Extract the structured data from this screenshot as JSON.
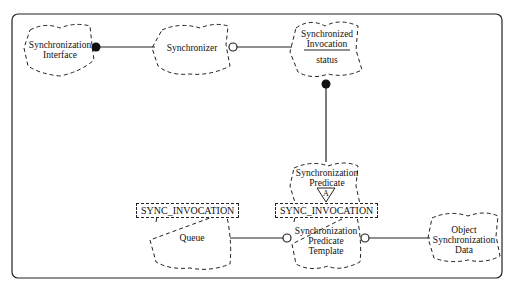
{
  "diagram": {
    "type": "Booch class diagram",
    "classes": [
      {
        "id": "sync_interface",
        "label_lines": [
          "Synchronization",
          "Interface"
        ]
      },
      {
        "id": "synchronizer",
        "label_lines": [
          "Synchronizer"
        ]
      },
      {
        "id": "sync_invocation",
        "label_lines": [
          "Synchronized",
          "Invocation"
        ],
        "attribute": "status"
      },
      {
        "id": "sync_predicate",
        "label_lines": [
          "Synchronization",
          "Predicate"
        ],
        "adornment": "A"
      },
      {
        "id": "queue",
        "label_lines": [
          "Queue"
        ],
        "template_param": "SYNC_INVOCATION"
      },
      {
        "id": "sync_predicate_template",
        "label_lines": [
          "Synchronization",
          "Predicate",
          "Template"
        ],
        "template_param": "SYNC_INVOCATION"
      },
      {
        "id": "object_sync_data",
        "label_lines": [
          "Object",
          "Synchronization",
          "Data"
        ]
      }
    ],
    "relationships": [
      {
        "from": "sync_interface",
        "to": "synchronizer",
        "kind": "has",
        "end": "filled-circle"
      },
      {
        "from": "synchronizer",
        "to": "sync_invocation",
        "kind": "uses",
        "end": "open-circle"
      },
      {
        "from": "sync_invocation",
        "to": "sync_predicate",
        "kind": "has",
        "end": "filled-circle"
      },
      {
        "from": "sync_predicate_template",
        "to": "sync_predicate",
        "kind": "instantiates",
        "end": "arrow"
      },
      {
        "from": "sync_predicate_template",
        "to": "queue",
        "kind": "uses",
        "end": "open-circle"
      },
      {
        "from": "sync_predicate_template",
        "to": "object_sync_data",
        "kind": "uses",
        "end": "open-circle"
      }
    ]
  },
  "labels": {
    "sync_interface": [
      "Synchronization",
      "Interface"
    ],
    "synchronizer": "Synchronizer",
    "sync_invocation": [
      "Synchronized",
      "Invocation"
    ],
    "sync_invocation_attr": "status",
    "sync_predicate": [
      "Synchronization",
      "Predicate"
    ],
    "abstract_adornment": "A",
    "queue": "Queue",
    "queue_template": "SYNC_INVOCATION",
    "spt": [
      "Synchronization",
      "Predicate",
      "Template"
    ],
    "spt_template": "SYNC_INVOCATION",
    "osd": [
      "Object",
      "Synchronization",
      "Data"
    ]
  }
}
